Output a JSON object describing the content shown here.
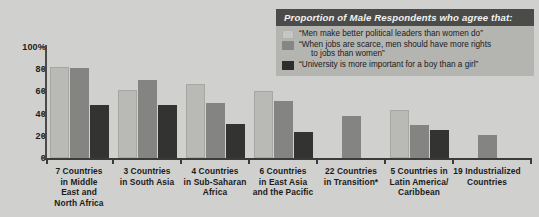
{
  "chart_data": {
    "type": "bar",
    "title": "Proportion of Male Respondents who agree that:",
    "xlabel": "",
    "ylabel": "",
    "ylim": [
      0,
      100
    ],
    "ytick_labels": [
      "100%",
      "80",
      "60",
      "40",
      "20",
      "0"
    ],
    "ytick_values": [
      100,
      80,
      60,
      40,
      20,
      0
    ],
    "grid": false,
    "legend_position": "top-right",
    "categories": [
      "7 Countries in Middle East and North Africa",
      "3 Countries in South Asia",
      "4 Countries in Sub-Saharan Africa",
      "6 Countries in East Asia and the Pacific",
      "22 Countries in Transition*",
      "5 Countries in Latin America/ Caribbean",
      "19 Industrialized Countries"
    ],
    "category_lines": [
      [
        "7 Countries",
        "in Middle",
        "East and",
        "North Africa"
      ],
      [
        "3 Countries",
        "in South Asia"
      ],
      [
        "4 Countries",
        "in Sub-Saharan",
        "Africa"
      ],
      [
        "6 Countries",
        "in East Asia",
        "and the Pacific"
      ],
      [
        "22 Countries",
        "in Transition*"
      ],
      [
        "5 Countries in",
        "Latin America/",
        "Caribbean"
      ],
      [
        "19 Industrialized",
        "Countries"
      ]
    ],
    "series": [
      {
        "name": "“Men make better political leaders than women do”",
        "color": "#b9b9b6",
        "values": [
          82,
          61,
          67,
          60,
          null,
          43,
          null
        ]
      },
      {
        "name": "“When jobs are scarce, men should have more rights to jobs than women”",
        "color": "#848482",
        "values": [
          81,
          70,
          50,
          51,
          38,
          30,
          21
        ]
      },
      {
        "name": "“University is more important for a boy than a girl”",
        "color": "#333331",
        "values": [
          48,
          48,
          31,
          23,
          null,
          25,
          null
        ]
      }
    ]
  },
  "legend": {
    "title": "Proportion of Male Respondents who agree that:",
    "items": [
      {
        "swatch": "s0",
        "line1": "“Men make better political leaders than women do”",
        "line2": ""
      },
      {
        "swatch": "s1",
        "line1": "“When jobs are scarce, men should have more rights",
        "line2": "to jobs than women”"
      },
      {
        "swatch": "s2",
        "line1": "“University is more important for a boy than a girl”",
        "line2": ""
      }
    ]
  }
}
